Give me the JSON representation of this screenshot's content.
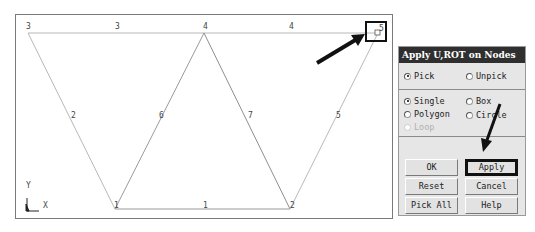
{
  "viewport": {
    "nodes": [
      {
        "id": "1",
        "x": 114,
        "y": 208
      },
      {
        "id": "2",
        "x": 289,
        "y": 208
      },
      {
        "id": "3",
        "x": 27,
        "y": 32
      },
      {
        "id": "4",
        "x": 203,
        "y": 32
      },
      {
        "id": "5",
        "x": 377,
        "y": 32
      }
    ],
    "node_labels": {
      "n1": "1",
      "n2": "2",
      "n3": "3",
      "n4": "4",
      "n5": "5"
    },
    "element_labels": {
      "e1": "1",
      "e2": "2",
      "e3": "3",
      "e4": "4",
      "e5": "5",
      "e6": "6",
      "e7": "7"
    },
    "axis": {
      "y_label": "Y",
      "x_label": "X"
    },
    "line_color": "#b5b5b5"
  },
  "dialog": {
    "title": "Apply U,ROT on Nodes",
    "pick_mode": {
      "pick": "Pick",
      "unpick": "Unpick",
      "selected": "Pick"
    },
    "pick_shape": {
      "single": "Single",
      "box": "Box",
      "polygon": "Polygon",
      "circle": "Circle",
      "loop": "Loop",
      "selected": "Single"
    },
    "buttons": {
      "ok": "OK",
      "apply": "Apply",
      "reset": "Reset",
      "cancel": "Cancel",
      "pick_all": "Pick All",
      "help": "Help"
    }
  },
  "annotations": {
    "arrow_color": "#111111"
  }
}
